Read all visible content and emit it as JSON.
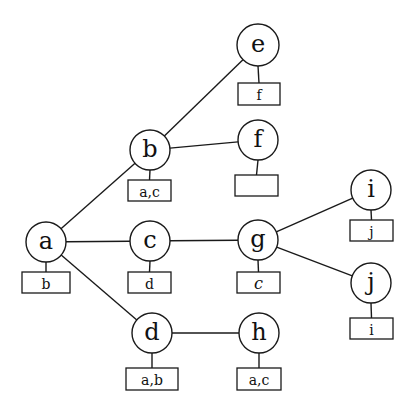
{
  "diagram": {
    "type": "graph",
    "nodes": [
      {
        "id": "a",
        "label": "a",
        "cx": 46,
        "cy": 242,
        "r": 20,
        "box": {
          "label": "b",
          "x": 22,
          "y": 272,
          "w": 48,
          "h": 21,
          "italic": false
        }
      },
      {
        "id": "b",
        "label": "b",
        "cx": 150,
        "cy": 150,
        "r": 20,
        "box": {
          "label": "a,c",
          "x": 128,
          "y": 180,
          "w": 43,
          "h": 21,
          "italic": false
        }
      },
      {
        "id": "c",
        "label": "c",
        "cx": 150,
        "cy": 241,
        "r": 20,
        "box": {
          "label": "d",
          "x": 128,
          "y": 272,
          "w": 43,
          "h": 21,
          "italic": false
        }
      },
      {
        "id": "d",
        "label": "d",
        "cx": 152,
        "cy": 333,
        "r": 20,
        "box": {
          "label": "a,b",
          "x": 126,
          "y": 368,
          "w": 52,
          "h": 22,
          "italic": false
        }
      },
      {
        "id": "e",
        "label": "e",
        "cx": 258,
        "cy": 45,
        "r": 21,
        "box": {
          "label": "f",
          "x": 238,
          "y": 83,
          "w": 42,
          "h": 22,
          "italic": false
        }
      },
      {
        "id": "f",
        "label": "f",
        "cx": 258,
        "cy": 140,
        "r": 20,
        "box": {
          "label": "",
          "x": 235,
          "y": 175,
          "w": 43,
          "h": 21,
          "italic": false
        }
      },
      {
        "id": "g",
        "label": "g",
        "cx": 258,
        "cy": 240,
        "r": 20,
        "box": {
          "label": "c",
          "x": 237,
          "y": 272,
          "w": 43,
          "h": 21,
          "italic": true
        }
      },
      {
        "id": "h",
        "label": "h",
        "cx": 259,
        "cy": 333,
        "r": 20,
        "box": {
          "label": "a,c",
          "x": 237,
          "y": 368,
          "w": 44,
          "h": 22,
          "italic": false
        }
      },
      {
        "id": "i",
        "label": "i",
        "cx": 371,
        "cy": 190,
        "r": 20,
        "box": {
          "label": "j",
          "x": 350,
          "y": 220,
          "w": 43,
          "h": 21,
          "italic": false
        }
      },
      {
        "id": "j",
        "label": "j",
        "cx": 371,
        "cy": 283,
        "r": 20,
        "box": {
          "label": "i",
          "x": 350,
          "y": 318,
          "w": 43,
          "h": 21,
          "italic": false
        }
      }
    ],
    "edges": [
      {
        "from": "a",
        "to": "b"
      },
      {
        "from": "a",
        "to": "c"
      },
      {
        "from": "a",
        "to": "d"
      },
      {
        "from": "b",
        "to": "e"
      },
      {
        "from": "b",
        "to": "f"
      },
      {
        "from": "c",
        "to": "g"
      },
      {
        "from": "g",
        "to": "i"
      },
      {
        "from": "g",
        "to": "j"
      },
      {
        "from": "d",
        "to": "h"
      }
    ],
    "colors": {
      "stroke": "#1a1a1a",
      "background": "#ffffff",
      "text": "#111111"
    }
  }
}
